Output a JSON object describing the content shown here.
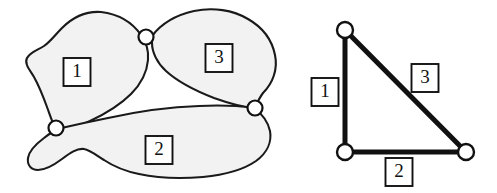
{
  "figure": {
    "background_color": "#ffffff",
    "outline_color": "#1a1a1a",
    "region_fill_color": "#f2f2f2",
    "node_fill_color": "#ffffff",
    "label_box_fill": "#ffffff",
    "label_text_color": "#111111"
  },
  "left_panel": {
    "name": "region-map",
    "caption": "",
    "regions": [
      {
        "id": "region-1",
        "label": "1",
        "label_x": 77,
        "label_y": 72,
        "fill": "#f2f2f2"
      },
      {
        "id": "region-2",
        "label": "2",
        "label_x": 159,
        "label_y": 150,
        "fill": "#f2f2f2"
      },
      {
        "id": "region-3",
        "label": "3",
        "label_x": 219,
        "label_y": 58,
        "fill": "#f2f2f2"
      }
    ],
    "junctions": [
      {
        "id": "junction-1-3",
        "x": 146,
        "y": 37,
        "r": 7.5
      },
      {
        "id": "junction-1-2",
        "x": 56,
        "y": 128,
        "r": 7.5
      },
      {
        "id": "junction-2-3",
        "x": 255,
        "y": 108,
        "r": 7.5
      }
    ]
  },
  "right_panel": {
    "name": "adjacency-graph",
    "caption": "",
    "nodes": [
      {
        "id": "node-top",
        "x": 345,
        "y": 30,
        "r": 8
      },
      {
        "id": "node-bottom-left",
        "x": 345,
        "y": 152,
        "r": 8
      },
      {
        "id": "node-bottom-right",
        "x": 466,
        "y": 152,
        "r": 8
      }
    ],
    "edges": [
      {
        "id": "edge-1",
        "label": "1",
        "from": "node-top",
        "to": "node-bottom-left",
        "width": 5,
        "label_x": 325,
        "label_y": 92
      },
      {
        "id": "edge-2",
        "label": "2",
        "from": "node-bottom-left",
        "to": "node-bottom-right",
        "width": 5,
        "label_x": 399,
        "label_y": 172
      },
      {
        "id": "edge-3",
        "label": "3",
        "from": "node-top",
        "to": "node-bottom-right",
        "width": 5,
        "label_x": 425,
        "label_y": 78
      }
    ]
  },
  "label_box": {
    "width": 27,
    "height": 28
  }
}
